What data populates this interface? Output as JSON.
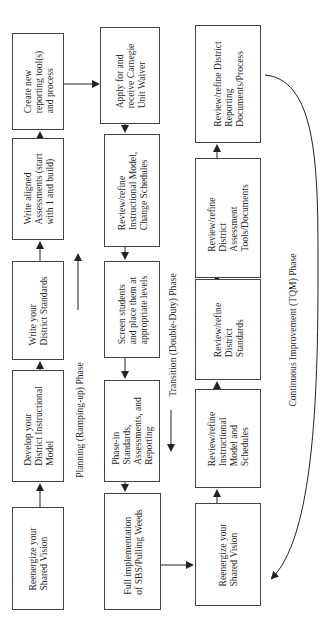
{
  "diagram": {
    "orientation": "rotated -90deg (read bottom to top)",
    "phases": {
      "planning": "Planning (Ramping-up) Phase",
      "transition": "Transition (Double-Duty) Phase",
      "continuous": "Continuous Improvement (TQM) Phase"
    },
    "column1": {
      "b1": "Reenergize your\nShared Vision",
      "b2": "Develop your\nDistrict Instructional\nModel",
      "b3": "Write your\nDistrict Standards",
      "b4": "Write aligned\nAssessments (start\nwith 1 and build)",
      "b5": "Create new\nreporting tool(s)\nand process"
    },
    "column2": {
      "b1": "Apply for and\nreceive Carnegie\nUnit Waiver",
      "b2": "Review/refine\nInstructional Model,\nChange Schedules",
      "b3": "Screen students\nand place them at\nappropriate levels",
      "b4": "Phase-in\nStandards,\nAssessments, and\nReporting",
      "b5": "Full implementation\nof SBS/Pulling Weeds"
    },
    "column3": {
      "b1": "Reenergize your\nShared Vision",
      "b2": "Review/refine\nInstructional\nModel and\nSchedules",
      "b3": "Review/refine\nDistrict\nStandards",
      "b4": "Review/refine\nDistrict\nAssessment\nTools/Documents",
      "b5": "Review/refine District\nReporting\nDocuments/Process"
    },
    "colors": {
      "line": "#222222",
      "border": "#444444",
      "background": "#ffffff"
    }
  }
}
